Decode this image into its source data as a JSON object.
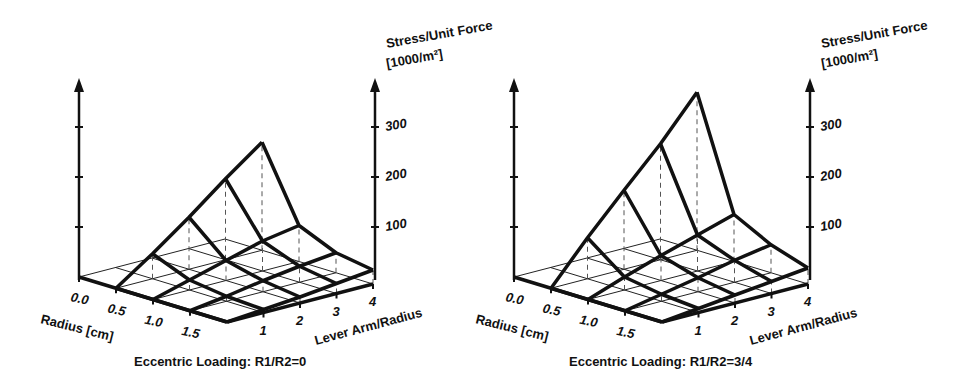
{
  "chart_data": [
    {
      "type": "surface3d",
      "title": "Eccentric Loading:  R1/R2=0",
      "xlabel": "Radius [cm]",
      "ylabel": "Lever Arm/Radius",
      "zlabel_line1": "Stress/Unit Force",
      "zlabel_line2": "[1000/m²]",
      "x_ticks": [
        "0.0",
        "0.5",
        "1.0",
        "1.5"
      ],
      "y_ticks": [
        "1",
        "2",
        "3",
        "4"
      ],
      "z_ticks": [
        "100",
        "200",
        "300"
      ],
      "zlim": [
        0,
        400
      ],
      "radius": [
        0.5,
        1.0,
        1.5,
        2.0
      ],
      "lever_arm": [
        0,
        1,
        2,
        3,
        4
      ],
      "values": [
        [
          0,
          50,
          104,
          162,
          216
        ],
        [
          0,
          20,
          40,
          60,
          72
        ],
        [
          0,
          10,
          22,
          32,
          40
        ],
        [
          0,
          6,
          12,
          20,
          28
        ]
      ],
      "grid": true
    },
    {
      "type": "surface3d",
      "title": "Eccentric Loading:  R1/R2=3/4",
      "xlabel": "Radius [cm]",
      "ylabel": "Lever Arm/Radius",
      "zlabel_line1": "Stress/Unit Force",
      "zlabel_line2": "[1000/m²]",
      "x_ticks": [
        "0.0",
        "0.5",
        "1.0",
        "1.5"
      ],
      "y_ticks": [
        "1",
        "2",
        "3",
        "4"
      ],
      "z_ticks": [
        "100",
        "200",
        "300"
      ],
      "zlim": [
        0,
        400
      ],
      "radius": [
        0.5,
        1.0,
        1.5,
        2.0
      ],
      "lever_arm": [
        0,
        1,
        2,
        3,
        4
      ],
      "values": [
        [
          0,
          82,
          158,
          232,
          316
        ],
        [
          0,
          26,
          50,
          72,
          94
        ],
        [
          0,
          14,
          28,
          44,
          56
        ],
        [
          0,
          8,
          16,
          24,
          32
        ]
      ],
      "grid": true
    }
  ],
  "colors": {
    "ink": "#111111",
    "grid": "#222222",
    "dash": "#555555",
    "background": "#ffffff"
  }
}
